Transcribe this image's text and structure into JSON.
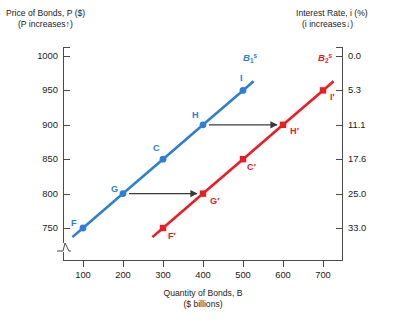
{
  "titles": {
    "left_axis_line1": "Price of Bonds,  P ($)",
    "left_axis_line2": "(P increases↑)",
    "right_axis_line1": "Interest Rate, i (%)",
    "right_axis_line2": "(i increases↓)",
    "x_axis_line1": "Quantity of Bonds, B",
    "x_axis_line2": "($ billions)"
  },
  "ticks": {
    "left": [
      "1000",
      "950",
      "900",
      "850",
      "800",
      "750"
    ],
    "right": [
      "0.0",
      "5.3",
      "11.1",
      "17.6",
      "25.0",
      "33.0"
    ],
    "x": [
      "100",
      "200",
      "300",
      "400",
      "500",
      "600",
      "700"
    ]
  },
  "colors": {
    "curve1": "#2e7fd4",
    "curve2": "#ed1c24",
    "axis": "#4a4a4a",
    "arrow": "#3a3a3a",
    "text": "#1b1b1b"
  },
  "curve_labels": {
    "curve1_base": "B",
    "curve1_sub": "1",
    "curve1_sup": "s",
    "curve2_base": "B",
    "curve2_sub": "2",
    "curve2_sup": "s"
  },
  "point_labels": {
    "c1": [
      "F",
      "G",
      "C",
      "H",
      "I"
    ],
    "c2": [
      "F′",
      "G′",
      "C′",
      "H′",
      "I′"
    ]
  },
  "chart_data": {
    "type": "line",
    "title": "",
    "xlabel": "Quantity of Bonds, B ($ billions)",
    "ylabel": "Price of Bonds, P ($)",
    "y2label": "Interest Rate, i (%)",
    "xlim": [
      50,
      750
    ],
    "ylim": [
      735,
      1000
    ],
    "xticks": [
      100,
      200,
      300,
      400,
      500,
      600,
      700
    ],
    "yticks": [
      750,
      800,
      850,
      900,
      950,
      1000
    ],
    "y2ticks": [
      33.0,
      25.0,
      17.6,
      11.1,
      5.3,
      0.0
    ],
    "y2tick_at_y": [
      750,
      800,
      850,
      900,
      950,
      1000
    ],
    "grid": false,
    "legend": "inline-curve-labels",
    "axis_break_left": true,
    "series": [
      {
        "name": "B1s",
        "color": "#2e7fd4",
        "x": [
          100,
          200,
          300,
          400,
          500
        ],
        "y": [
          750,
          800,
          850,
          900,
          950
        ],
        "point_labels": [
          "F",
          "G",
          "C",
          "H",
          "I"
        ]
      },
      {
        "name": "B2s",
        "color": "#ed1c24",
        "x": [
          300,
          400,
          500,
          600,
          700
        ],
        "y": [
          750,
          800,
          850,
          900,
          950
        ],
        "point_labels": [
          "F'",
          "G'",
          "C'",
          "H'",
          "I'"
        ]
      }
    ],
    "annotations": [
      {
        "type": "arrow",
        "from": [
          215,
          800
        ],
        "to": [
          385,
          800
        ]
      },
      {
        "type": "arrow",
        "from": [
          415,
          900
        ],
        "to": [
          585,
          900
        ]
      }
    ]
  }
}
